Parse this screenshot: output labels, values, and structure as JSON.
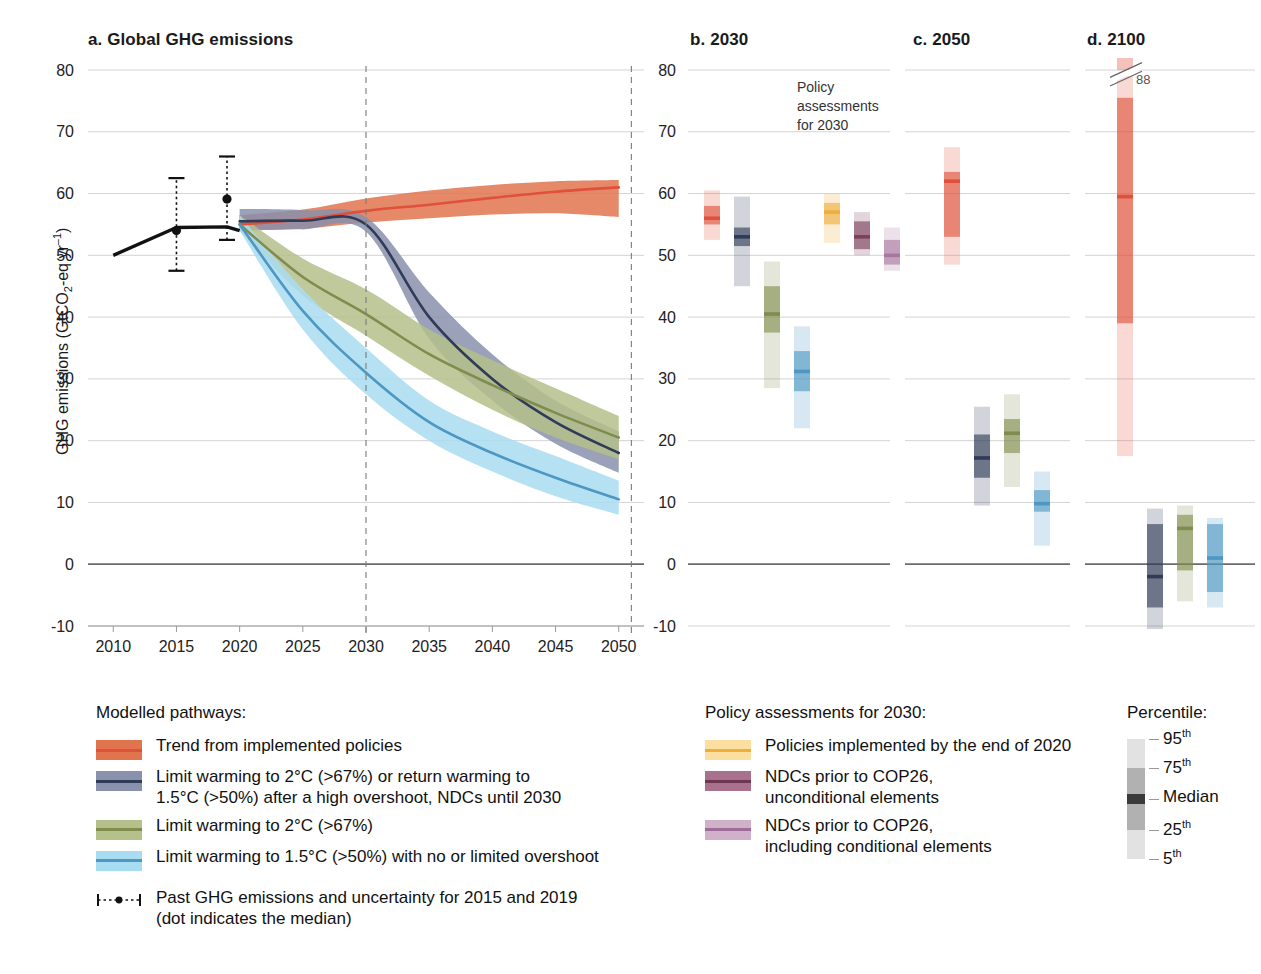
{
  "figure": {
    "panels": [
      {
        "id": "a",
        "label": "a. Global GHG emissions"
      },
      {
        "id": "b",
        "label": "b. 2030"
      },
      {
        "id": "c",
        "label": "c. 2050"
      },
      {
        "id": "d",
        "label": "d. 2100"
      }
    ],
    "annotation_policy": "Policy\nassessments\nfor 2030",
    "annotation_policy_lines": [
      "Policy",
      "assessments",
      "for 2030"
    ],
    "break_value_label": "88"
  },
  "chart_data": {
    "type": "line",
    "title": "a. Global GHG emissions",
    "xlabel": "",
    "ylabel": "GHG emissions (GtCO₂-eq yr⁻¹)",
    "ylabel_parts": {
      "pre": "GHG emissions (GtCO",
      "sub": "2",
      "mid": "-eq yr",
      "sup": "-1",
      "post": ")"
    },
    "xlim": [
      2008,
      2052
    ],
    "ylim": [
      -10,
      80
    ],
    "yticks": [
      80,
      70,
      60,
      50,
      40,
      30,
      20,
      10,
      0,
      -10
    ],
    "xticks": [
      2010,
      2015,
      2020,
      2025,
      2030,
      2035,
      2040,
      2045,
      2050
    ],
    "grid": true,
    "vertical_markers": [
      2030,
      2051
    ],
    "legend_position": "below",
    "historical": {
      "name": "Historical GHG emissions",
      "x": [
        2010,
        2015,
        2019,
        2020
      ],
      "y": [
        50.0,
        54.5,
        54.6,
        54.0
      ]
    },
    "past_uncertainty": [
      {
        "year": 2015,
        "median": 54.0,
        "low": 47.5,
        "high": 62.5
      },
      {
        "year": 2019,
        "median": 59.1,
        "low": 52.5,
        "high": 66.0
      }
    ],
    "series": [
      {
        "name": "Trend from implemented policies",
        "color": "#e0503a",
        "band_color": "#e0744f",
        "x": [
          2020,
          2025,
          2030,
          2035,
          2040,
          2045,
          2050
        ],
        "median": [
          55.0,
          55.8,
          57.2,
          58.2,
          59.3,
          60.3,
          61.0
        ],
        "low": [
          54.0,
          54.3,
          55.3,
          56.0,
          56.6,
          56.8,
          56.2
        ],
        "high": [
          56.5,
          57.4,
          59.2,
          60.5,
          61.4,
          62.0,
          62.2
        ]
      },
      {
        "name": "Limit warming to 2°C (>67%) or return warming to 1.5°C (>50%) after a high overshoot, NDCs until 2030",
        "color": "#2f3b57",
        "band_color": "#8a91ac",
        "x": [
          2020,
          2025,
          2030,
          2035,
          2040,
          2045,
          2050
        ],
        "median": [
          55.5,
          55.6,
          55.0,
          40.0,
          30.0,
          23.0,
          18.0
        ],
        "low": [
          54.0,
          54.2,
          53.8,
          36.5,
          26.5,
          19.5,
          14.8
        ],
        "high": [
          57.5,
          57.3,
          56.2,
          44.0,
          34.0,
          26.5,
          21.5
        ]
      },
      {
        "name": "Limit warming to 2°C (>67%)",
        "color": "#7f8c4e",
        "band_color": "#b5c08a",
        "x": [
          2020,
          2025,
          2030,
          2035,
          2040,
          2045,
          2050
        ],
        "median": [
          55.0,
          46.5,
          40.5,
          34.0,
          29.0,
          24.5,
          20.5
        ],
        "low": [
          54.0,
          43.5,
          37.0,
          30.5,
          25.0,
          20.5,
          17.0
        ],
        "high": [
          56.5,
          49.5,
          44.5,
          38.0,
          33.0,
          28.5,
          24.0
        ]
      },
      {
        "name": "Limit warming to 1.5°C (>50%) with no or limited overshoot",
        "color": "#4d97c4",
        "band_color": "#a8dcf0",
        "x": [
          2020,
          2025,
          2030,
          2035,
          2040,
          2045,
          2050
        ],
        "median": [
          55.0,
          41.0,
          31.0,
          23.0,
          18.0,
          14.0,
          10.5
        ],
        "low": [
          54.0,
          38.0,
          27.5,
          20.0,
          15.0,
          11.0,
          8.0
        ],
        "high": [
          56.5,
          44.5,
          35.0,
          26.5,
          21.5,
          17.5,
          13.5
        ]
      }
    ],
    "panel_b": {
      "title": "b. 2030",
      "ylim": [
        -10,
        80
      ],
      "bars": [
        {
          "name": "Trend from implemented policies",
          "color": "#e0503a",
          "p5": 52.5,
          "p25": 55.0,
          "median": 56.0,
          "p75": 58.0,
          "p95": 60.5
        },
        {
          "name": "Limit warming to 2°C (>67%) / high overshoot NDC",
          "color": "#2f3b57",
          "p5": 45.0,
          "p25": 51.5,
          "median": 53.0,
          "p75": 54.5,
          "p95": 59.5
        },
        {
          "name": "Limit warming to 2°C (>67%)",
          "color": "#7f8c4e",
          "p5": 28.5,
          "p25": 37.5,
          "median": 40.5,
          "p75": 45.0,
          "p95": 49.0
        },
        {
          "name": "Limit warming to 1.5°C (>50%)",
          "color": "#4d97c4",
          "p5": 22.0,
          "p25": 28.0,
          "median": 31.2,
          "p75": 34.5,
          "p95": 38.5
        },
        {
          "name": "Policies implemented by the end of 2020",
          "color": "#edae3c",
          "p5": 52.0,
          "p25": 55.0,
          "median": 57.0,
          "p75": 58.5,
          "p95": 60.0
        },
        {
          "name": "NDCs prior to COP26, unconditional elements",
          "color": "#7c3f5c",
          "p5": 50.0,
          "p25": 51.0,
          "median": 53.0,
          "p75": 55.5,
          "p95": 57.0
        },
        {
          "name": "NDCs prior to COP26, including conditional elements",
          "color": "#a877a0",
          "p5": 47.5,
          "p25": 48.5,
          "median": 50.0,
          "p75": 52.5,
          "p95": 54.5
        }
      ]
    },
    "panel_c": {
      "title": "c. 2050",
      "ylim": [
        -10,
        80
      ],
      "bars": [
        {
          "name": "Trend from implemented policies",
          "color": "#e0503a",
          "p5": 48.5,
          "p25": 53.0,
          "median": 62.0,
          "p75": 63.5,
          "p95": 67.5
        },
        {
          "name": "Limit warming to 2°C (>67%) / high overshoot NDC",
          "color": "#2f3b57",
          "p5": 9.5,
          "p25": 14.0,
          "median": 17.2,
          "p75": 21.0,
          "p95": 25.5
        },
        {
          "name": "Limit warming to 2°C (>67%)",
          "color": "#7f8c4e",
          "p5": 12.5,
          "p25": 18.0,
          "median": 21.2,
          "p75": 23.5,
          "p95": 27.5
        },
        {
          "name": "Limit warming to 1.5°C (>50%)",
          "color": "#4d97c4",
          "p5": 3.0,
          "p25": 8.5,
          "median": 9.8,
          "p75": 12.0,
          "p95": 15.0
        }
      ]
    },
    "panel_d": {
      "title": "d. 2100",
      "ylim": [
        -10,
        80
      ],
      "break_label": "88",
      "bars": [
        {
          "name": "Trend from implemented policies",
          "color": "#e0503a",
          "p5": 17.5,
          "p25": 39.0,
          "median": 59.5,
          "p75": 75.5,
          "p95": 88.0,
          "broken_top": true
        },
        {
          "name": "Limit warming to 2°C (>67%) / high overshoot NDC",
          "color": "#2f3b57",
          "p5": -10.5,
          "p25": -7.0,
          "median": -2.0,
          "p75": 6.5,
          "p95": 9.0
        },
        {
          "name": "Limit warming to 2°C (>67%)",
          "color": "#7f8c4e",
          "p5": -6.0,
          "p25": -1.0,
          "median": 5.8,
          "p75": 8.0,
          "p95": 9.5
        },
        {
          "name": "Limit warming to 1.5°C (>50%)",
          "color": "#4d97c4",
          "p5": -7.0,
          "p25": -4.5,
          "median": 1.0,
          "p75": 6.5,
          "p95": 7.5
        }
      ]
    }
  },
  "legend_pathways": {
    "heading": "Modelled pathways:",
    "items": [
      {
        "label": "Trend from implemented policies",
        "line": "#e0503a",
        "band": "#e0744f",
        "lines": [
          "Trend from implemented policies"
        ]
      },
      {
        "label": "Limit warming to 2°C (>67%) or return warming to 1.5°C (>50%) after a high overshoot, NDCs until 2030",
        "line": "#2f3b57",
        "band": "#8a91ac",
        "lines": [
          "Limit warming to 2°C (>67%) or return warming to",
          "1.5°C (>50%) after a high overshoot, NDCs until 2030"
        ]
      },
      {
        "label": "Limit warming to 2°C (>67%)",
        "line": "#7f8c4e",
        "band": "#b5c08a",
        "lines": [
          "Limit warming to 2°C (>67%)"
        ]
      },
      {
        "label": "Limit warming to 1.5°C (>50%) with no or limited overshoot",
        "line": "#4d97c4",
        "band": "#a8dcf0",
        "lines": [
          "Limit warming to 1.5°C (>50%) with no or limited overshoot"
        ]
      }
    ],
    "past": {
      "lines": [
        "Past GHG emissions and uncertainty for 2015 and 2019",
        "(dot indicates the median)"
      ],
      "line1": "Past GHG emissions and uncertainty for 2015 and 2019",
      "line2": "(dot indicates the median)"
    }
  },
  "legend_policy": {
    "heading": "Policy assessments for 2030:",
    "items": [
      {
        "line": "#edae3c",
        "band": "#fbdfa0",
        "lines": [
          "Policies implemented by the end of 2020"
        ]
      },
      {
        "line": "#6e3651",
        "band": "#a8718e",
        "lines": [
          "NDCs prior to COP26,",
          "unconditional elements"
        ]
      },
      {
        "line": "#9d6d97",
        "band": "#cfb2ca",
        "lines": [
          "NDCs prior to COP26,",
          "including conditional elements"
        ]
      }
    ]
  },
  "legend_percentile": {
    "heading": "Percentile:",
    "labels": [
      {
        "text": "95",
        "sup": "th"
      },
      {
        "text": "75",
        "sup": "th"
      },
      {
        "text": "Median",
        "sup": ""
      },
      {
        "text": "25",
        "sup": "th"
      },
      {
        "text": "5",
        "sup": "th"
      }
    ]
  }
}
